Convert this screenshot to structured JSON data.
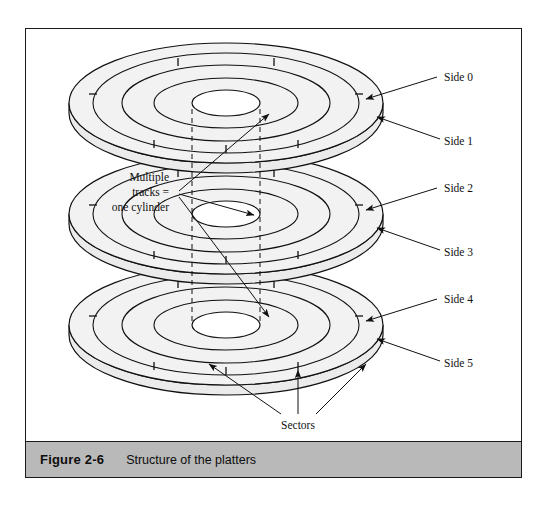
{
  "figure": {
    "caption_number": "Figure 2-6",
    "caption_title": "Structure of the platters"
  },
  "annotations": {
    "cylinder_line1": "Multiple",
    "cylinder_line2": "tracks =",
    "cylinder_line3": "one cylinder",
    "sectors": "Sectors"
  },
  "side_labels": [
    {
      "text": "Side 0"
    },
    {
      "text": "Side 1"
    },
    {
      "text": "Side 2"
    },
    {
      "text": "Side 3"
    },
    {
      "text": "Side 4"
    },
    {
      "text": "Side 5"
    }
  ],
  "colors": {
    "platter_top": "#f2f2f2",
    "platter_rim": "#ebebeb",
    "outline": "#111111",
    "caption_bar": "#b9b9b9",
    "page_background": "#ffffff"
  },
  "diagram": {
    "platter_count": 3,
    "tracks_per_platter": 3
  }
}
